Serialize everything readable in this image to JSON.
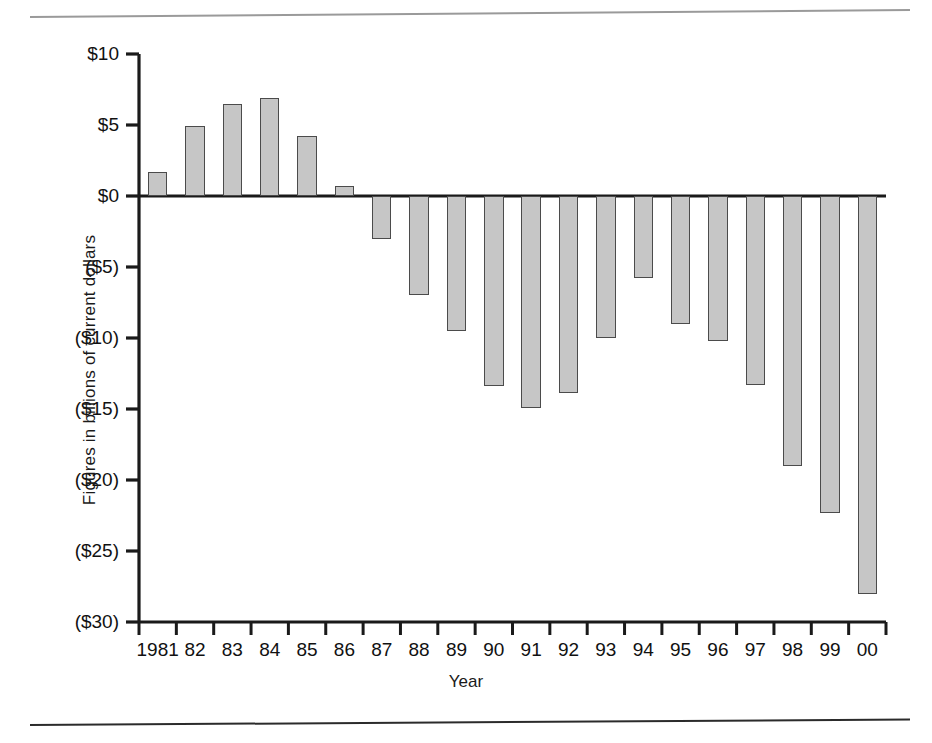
{
  "figure": {
    "top_rule": "horizontal-rule",
    "bottom_rule": "horizontal-rule"
  },
  "chart_data": {
    "type": "bar",
    "title": "",
    "xlabel": "Year",
    "ylabel": "Figures in billions of current dollars",
    "categories": [
      "1981",
      "82",
      "83",
      "84",
      "85",
      "86",
      "87",
      "88",
      "89",
      "90",
      "91",
      "92",
      "93",
      "94",
      "95",
      "96",
      "97",
      "98",
      "99",
      "00"
    ],
    "values": [
      1.7,
      4.9,
      6.5,
      6.9,
      4.2,
      0.7,
      -3.0,
      -7.0,
      -9.5,
      -13.4,
      -14.9,
      -13.9,
      -10.0,
      -5.8,
      -9.0,
      -10.2,
      -13.3,
      -19.0,
      -22.3,
      -28.0
    ],
    "ylim": [
      -30,
      10
    ],
    "ytick_values": [
      10,
      5,
      0,
      -5,
      -10,
      -15,
      -20,
      -25,
      -30
    ],
    "ytick_labels": [
      "$10",
      "$5",
      "$0",
      "($5)",
      "($10)",
      "($15)",
      "($20)",
      "($25)",
      "($30)"
    ],
    "grid": false,
    "legend": null,
    "bar_fill_color": "#c6c6c6",
    "bar_border_color": "#4b4b4b",
    "axis_color": "#1a1a1a"
  }
}
